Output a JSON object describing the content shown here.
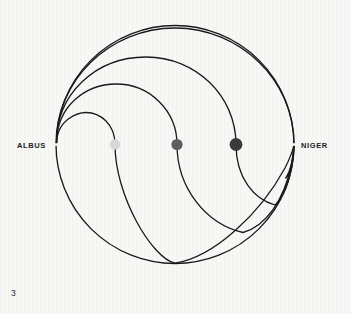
{
  "figure": {
    "number": "3",
    "left_label": "ALBUS",
    "right_label": "NIGER",
    "line_color": "#1a1a1a",
    "background_color": "#f7f7f5"
  },
  "chart_data": {
    "type": "diagram",
    "title": "",
    "subtitle": "",
    "xlabel": "",
    "ylabel": "",
    "annotations": [
      "ALBUS",
      "NIGER",
      "3"
    ],
    "legend": [],
    "grid": false,
    "circle": {
      "cx": 175,
      "cy": 144.5,
      "r": 119
    },
    "poles": [
      {
        "name": "ALBUS",
        "x": 56,
        "y": 144.5,
        "tone": "white",
        "side": "left"
      },
      {
        "name": "NIGER",
        "x": 294,
        "y": 144.5,
        "tone": "black",
        "side": "right"
      }
    ],
    "nodes": [
      {
        "index": 1,
        "x": 115,
        "y": 144.5,
        "r": 5.0,
        "color": "#d9d9d9",
        "tone_value": 0.15
      },
      {
        "index": 2,
        "x": 177,
        "y": 144.5,
        "r": 5.6,
        "color": "#5e5e5e",
        "tone_value": 0.63
      },
      {
        "index": 3,
        "x": 236,
        "y": 144.5,
        "r": 6.4,
        "color": "#3a3a3a",
        "tone_value": 0.8
      }
    ],
    "curves": [
      {
        "index": 1,
        "name": "curve-inner",
        "crossing_x": 115,
        "apex_y": 113,
        "trough_y": 258
      },
      {
        "index": 2,
        "name": "curve-second",
        "crossing_x": 177,
        "apex_y": 84,
        "trough_y": 232
      },
      {
        "index": 3,
        "name": "curve-third",
        "crossing_x": 236,
        "apex_y": 57,
        "trough_y": 205
      },
      {
        "index": 4,
        "name": "curve-outer",
        "crossing_x": 294,
        "apex_y": 28,
        "trough_y": 178
      }
    ]
  }
}
